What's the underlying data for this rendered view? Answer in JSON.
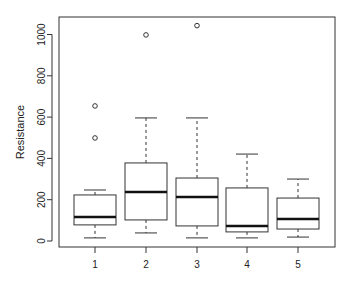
{
  "chart_data": {
    "type": "box",
    "title": "",
    "xlabel": "",
    "ylabel": "Resistance",
    "ylim": [
      -25,
      1075
    ],
    "yticks": [
      0,
      200,
      400,
      600,
      800,
      1000
    ],
    "categories": [
      "1",
      "2",
      "3",
      "4",
      "5"
    ],
    "grid": false,
    "legend": null,
    "boxes": [
      {
        "label": "1",
        "whisker_low": 15,
        "q1": 78,
        "median": 116,
        "q3": 223,
        "whisker_high": 247,
        "outliers": [
          499,
          654
        ]
      },
      {
        "label": "2",
        "whisker_low": 39,
        "q1": 102,
        "median": 237,
        "q3": 378,
        "whisker_high": 596,
        "outliers": [
          998
        ]
      },
      {
        "label": "3",
        "whisker_low": 15,
        "q1": 73,
        "median": 213,
        "q3": 305,
        "whisker_high": 596,
        "outliers": [
          1043
        ]
      },
      {
        "label": "4",
        "whisker_low": 15,
        "q1": 44,
        "median": 73,
        "q3": 257,
        "whisker_high": 421,
        "outliers": []
      },
      {
        "label": "5",
        "whisker_low": 19,
        "q1": 58,
        "median": 106,
        "q3": 208,
        "whisker_high": 300,
        "outliers": []
      }
    ]
  }
}
